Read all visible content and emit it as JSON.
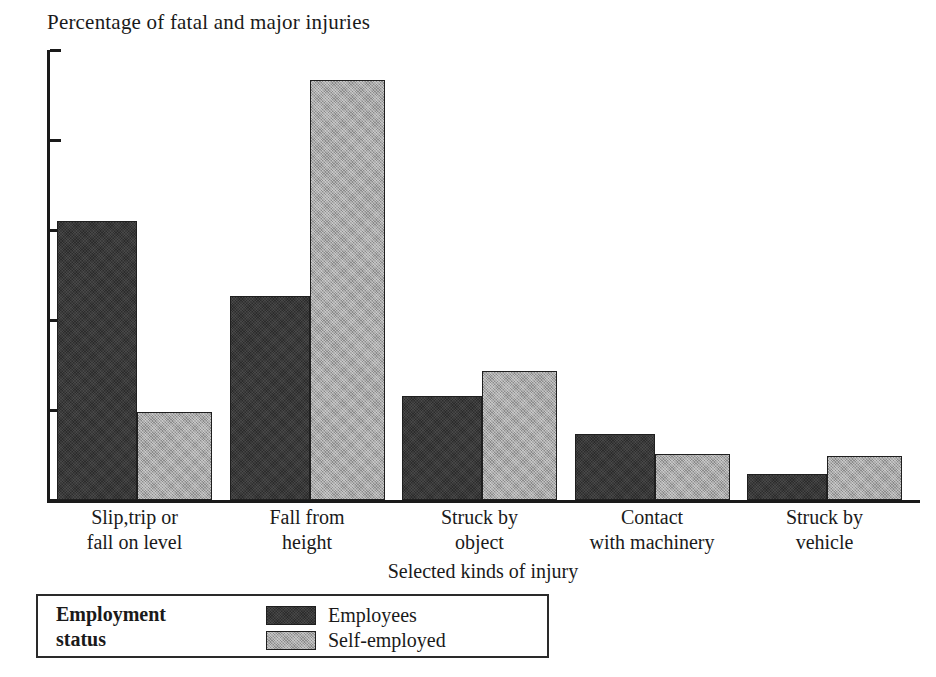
{
  "chart_data": {
    "type": "bar",
    "title": "Percentage of fatal and major injuries",
    "xlabel": "Selected kinds of injury",
    "ylabel": "",
    "ylim": [
      0,
      50
    ],
    "ytick_values": [
      0,
      10,
      20,
      30,
      40,
      50
    ],
    "ytick_labels": [
      "0",
      "10",
      "20",
      "30",
      "40",
      "50"
    ],
    "grid": false,
    "legend_position": "below-plot-left",
    "legend_title": "Employment\nstatus",
    "legend_title_line1": "Employment",
    "legend_title_line2": "status",
    "categories": [
      "Slip,trip or\nfall on level",
      "Fall from\nheight",
      "Struck by\nobject",
      "Contact\nwith machinery",
      "Struck by\nvehicle"
    ],
    "category_lines": [
      [
        "Slip,trip or",
        "fall on level"
      ],
      [
        "Fall from",
        "height"
      ],
      [
        "Struck by",
        "object"
      ],
      [
        "Contact",
        "with machinery"
      ],
      [
        "Struck by",
        "vehicle"
      ]
    ],
    "series": [
      {
        "name": "Employees",
        "color": "#3a3a3a",
        "values": [
          31.0,
          22.7,
          11.6,
          7.3,
          2.9
        ]
      },
      {
        "name": "Self-employed",
        "color": "#a9a9a9",
        "values": [
          9.8,
          46.7,
          14.3,
          5.1,
          4.9
        ]
      }
    ]
  },
  "colors": {
    "employees": "#3a3a3a",
    "self_employed": "#a9a9a9",
    "axis": "#1a1a1a",
    "background": "#ffffff"
  }
}
